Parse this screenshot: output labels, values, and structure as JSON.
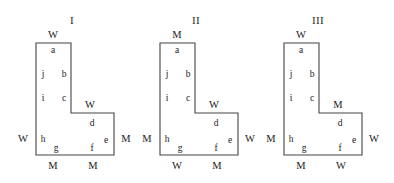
{
  "page": {
    "background_color": "#ffffff",
    "stroke_color": "#444444",
    "text_color": "#222222"
  },
  "figures": [
    {
      "id": "figure-1",
      "roman_label": "I",
      "roman_x": 72,
      "roman_y": 20,
      "outline": "36,43 36,155 114,155 114,113 71,113 71,43",
      "outer_labels": [
        {
          "name": "top-label",
          "text": "W",
          "x": 53,
          "y": 35
        },
        {
          "name": "left-label",
          "text": "W",
          "x": 23,
          "y": 139
        },
        {
          "name": "right-label",
          "text": "M",
          "x": 126,
          "y": 139
        },
        {
          "name": "bottom-left-label",
          "text": "M",
          "x": 53,
          "y": 166
        },
        {
          "name": "bottom-right-label",
          "text": "M",
          "x": 93,
          "y": 166
        },
        {
          "name": "step-label",
          "text": "W",
          "x": 90,
          "y": 105
        }
      ],
      "inner_labels": [
        {
          "name": "edge-a",
          "text": "a",
          "x": 53,
          "y": 51
        },
        {
          "name": "edge-b",
          "text": "b",
          "x": 64,
          "y": 75
        },
        {
          "name": "edge-c",
          "text": "c",
          "x": 64,
          "y": 99
        },
        {
          "name": "edge-d",
          "text": "d",
          "x": 92,
          "y": 124
        },
        {
          "name": "edge-e",
          "text": "e",
          "x": 106,
          "y": 141
        },
        {
          "name": "edge-f",
          "text": "f",
          "x": 92,
          "y": 149
        },
        {
          "name": "edge-g",
          "text": "g",
          "x": 56,
          "y": 149
        },
        {
          "name": "edge-h",
          "text": "h",
          "x": 43,
          "y": 140
        },
        {
          "name": "edge-i",
          "text": "i",
          "x": 43,
          "y": 99
        },
        {
          "name": "edge-j",
          "text": "j",
          "x": 43,
          "y": 75
        }
      ]
    },
    {
      "id": "figure-2",
      "roman_label": "II",
      "roman_x": 196,
      "roman_y": 20,
      "outline": "160,43 160,155 238,155 238,113 195,113 195,43",
      "outer_labels": [
        {
          "name": "top-label",
          "text": "M",
          "x": 177,
          "y": 35
        },
        {
          "name": "left-label",
          "text": "M",
          "x": 147,
          "y": 139
        },
        {
          "name": "right-label",
          "text": "W",
          "x": 250,
          "y": 139
        },
        {
          "name": "bottom-left-label",
          "text": "W",
          "x": 177,
          "y": 166
        },
        {
          "name": "bottom-right-label",
          "text": "M",
          "x": 217,
          "y": 166
        },
        {
          "name": "step-label",
          "text": "W",
          "x": 214,
          "y": 105
        }
      ],
      "inner_labels": [
        {
          "name": "edge-a",
          "text": "a",
          "x": 177,
          "y": 51
        },
        {
          "name": "edge-b",
          "text": "b",
          "x": 188,
          "y": 75
        },
        {
          "name": "edge-c",
          "text": "c",
          "x": 188,
          "y": 99
        },
        {
          "name": "edge-d",
          "text": "d",
          "x": 216,
          "y": 124
        },
        {
          "name": "edge-e",
          "text": "e",
          "x": 230,
          "y": 141
        },
        {
          "name": "edge-f",
          "text": "f",
          "x": 216,
          "y": 149
        },
        {
          "name": "edge-g",
          "text": "g",
          "x": 180,
          "y": 149
        },
        {
          "name": "edge-h",
          "text": "h",
          "x": 167,
          "y": 140
        },
        {
          "name": "edge-i",
          "text": "i",
          "x": 167,
          "y": 99
        },
        {
          "name": "edge-j",
          "text": "j",
          "x": 167,
          "y": 75
        }
      ]
    },
    {
      "id": "figure-3",
      "roman_label": "III",
      "roman_x": 318,
      "roman_y": 20,
      "outline": "284,43 284,155 362,155 362,113 319,113 319,43",
      "outer_labels": [
        {
          "name": "top-label",
          "text": "W",
          "x": 301,
          "y": 35
        },
        {
          "name": "left-label",
          "text": "M",
          "x": 271,
          "y": 139
        },
        {
          "name": "right-label",
          "text": "W",
          "x": 374,
          "y": 139
        },
        {
          "name": "bottom-left-label",
          "text": "M",
          "x": 301,
          "y": 166
        },
        {
          "name": "bottom-right-label",
          "text": "W",
          "x": 341,
          "y": 166
        },
        {
          "name": "step-label",
          "text": "M",
          "x": 338,
          "y": 105
        }
      ],
      "inner_labels": [
        {
          "name": "edge-a",
          "text": "a",
          "x": 301,
          "y": 51
        },
        {
          "name": "edge-b",
          "text": "b",
          "x": 312,
          "y": 75
        },
        {
          "name": "edge-c",
          "text": "c",
          "x": 312,
          "y": 99
        },
        {
          "name": "edge-d",
          "text": "d",
          "x": 340,
          "y": 124
        },
        {
          "name": "edge-e",
          "text": "e",
          "x": 354,
          "y": 141
        },
        {
          "name": "edge-f",
          "text": "f",
          "x": 340,
          "y": 149
        },
        {
          "name": "edge-g",
          "text": "g",
          "x": 304,
          "y": 149
        },
        {
          "name": "edge-h",
          "text": "h",
          "x": 291,
          "y": 140
        },
        {
          "name": "edge-i",
          "text": "i",
          "x": 291,
          "y": 99
        },
        {
          "name": "edge-j",
          "text": "j",
          "x": 291,
          "y": 75
        }
      ]
    }
  ]
}
